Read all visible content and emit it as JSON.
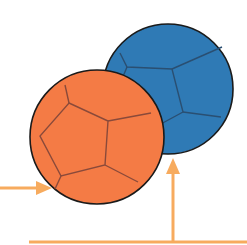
{
  "diagram": {
    "colors": {
      "background": "#ffffff",
      "blue_ball": "#2f7ab5",
      "orange_ball": "#f47b45",
      "ball_outline": "#1a1a1a",
      "seam_blue": "#2a4f72",
      "seam_orange": "#8a4a3a",
      "arrow": "#f7ab5e"
    },
    "balls": [
      {
        "name": "blue-ball",
        "cx": 168,
        "cy": 89,
        "r": 65
      },
      {
        "name": "orange-ball",
        "cx": 97,
        "cy": 137,
        "r": 67
      }
    ],
    "arrows": [
      {
        "name": "horizontal-arrow",
        "direction": "right",
        "from": [
          0,
          188
        ],
        "to": [
          51,
          188
        ]
      },
      {
        "name": "vertical-arrow",
        "direction": "up",
        "from": [
          173,
          242
        ],
        "to": [
          173,
          159
        ]
      }
    ],
    "lines": [
      {
        "name": "baseline",
        "from": [
          29,
          242
        ],
        "to": [
          247,
          242
        ]
      }
    ]
  }
}
